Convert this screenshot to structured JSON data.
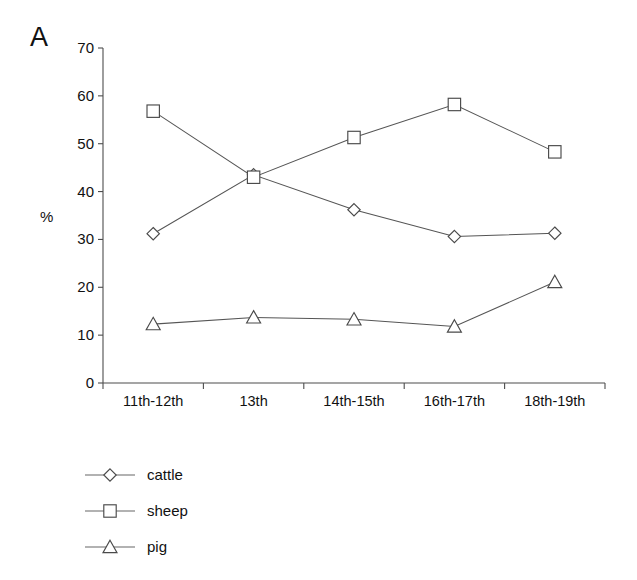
{
  "panel": {
    "letter": "A"
  },
  "chart_data": {
    "type": "line",
    "title": "",
    "subtitle": "",
    "xlabel": "",
    "ylabel": "%",
    "categories": [
      "11th-12th",
      "13th",
      "14th-15th",
      "16th-17th",
      "18th-19th"
    ],
    "ylim": [
      0,
      70
    ],
    "yticks": [
      0,
      10,
      20,
      30,
      40,
      50,
      60,
      70
    ],
    "ytick_labels": [
      "0",
      "10",
      "20",
      "30",
      "40",
      "50",
      "60",
      "70"
    ],
    "grid": false,
    "legend_position": "bottom-left",
    "series": [
      {
        "name": "cattle",
        "marker": "diamond",
        "values": [
          31.2,
          43.5,
          36.2,
          30.6,
          31.3
        ]
      },
      {
        "name": "sheep",
        "marker": "square",
        "values": [
          56.8,
          43.0,
          51.3,
          58.2,
          48.3
        ]
      },
      {
        "name": "pig",
        "marker": "triangle",
        "values": [
          12.3,
          13.7,
          13.3,
          11.8,
          21.1
        ]
      }
    ],
    "colors": {
      "line": "#555555",
      "marker_stroke": "#4a4a4a",
      "marker_fill": "#ffffff",
      "axis": "#4d4d4d",
      "text": "#111111",
      "background": "#ffffff"
    }
  },
  "legend": {
    "items": [
      {
        "label": "cattle",
        "marker": "diamond"
      },
      {
        "label": "sheep",
        "marker": "square"
      },
      {
        "label": "pig",
        "marker": "triangle"
      }
    ]
  }
}
